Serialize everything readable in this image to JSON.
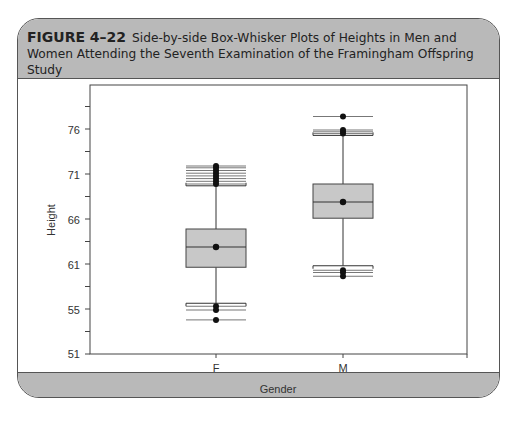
{
  "figure": {
    "label": "FIGURE 4–22",
    "caption": "Side-by-side Box-Whisker Plots of Heights in Men and Women Attending the Seventh Examination of the Framingham Offspring Study"
  },
  "chart_data": {
    "type": "box",
    "title": "Side-by-side Box-Whisker Plots of Heights in Men and Women Attending the Seventh Examination of the Framingham Offspring Study",
    "xlabel": "Gender",
    "ylabel": "Height",
    "categories": [
      "F",
      "M"
    ],
    "y_tick_labels": [
      "51",
      "55",
      "61",
      "66",
      "71",
      "76"
    ],
    "ylim": [
      51,
      79
    ],
    "grid": false,
    "legend": null,
    "series": [
      {
        "name": "F",
        "whisker_low": 55.9,
        "q1": 60.7,
        "median": 63.0,
        "mean": 63.0,
        "q3": 65.0,
        "whisker_high": 69.8,
        "outliers_high": [
          70.0,
          70.3,
          70.6,
          70.9,
          71.2,
          71.5,
          71.8,
          72.0
        ],
        "outliers_low": [
          55.5,
          55.0,
          54.1
        ]
      },
      {
        "name": "M",
        "whisker_low": 60.9,
        "q1": 66.2,
        "median": 68.0,
        "mean": 68.0,
        "q3": 70.0,
        "whisker_high": 75.4,
        "outliers_high": [
          75.6,
          75.8,
          76.0,
          77.5
        ],
        "outliers_low": [
          60.3,
          60.0,
          59.5
        ]
      }
    ]
  }
}
